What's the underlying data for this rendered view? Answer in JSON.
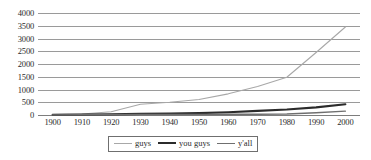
{
  "chart_data": {
    "type": "line",
    "title": "",
    "subtitle": "",
    "xlabel": "",
    "ylabel": "",
    "xlim": [
      1895,
      2005
    ],
    "ylim": [
      0,
      4000
    ],
    "grid": true,
    "legend_position": "bottom",
    "x": [
      1900,
      1910,
      1920,
      1930,
      1940,
      1950,
      1960,
      1970,
      1980,
      1990,
      2000
    ],
    "xtick_labels": [
      "1900",
      "1910",
      "1920",
      "1930",
      "1940",
      "1950",
      "1960",
      "1970",
      "1980",
      "1990",
      "2000"
    ],
    "ytick_labels": [
      "0",
      "500",
      "1000",
      "1500",
      "2000",
      "2500",
      "3000",
      "3500",
      "4000"
    ],
    "yticks": [
      0,
      500,
      1000,
      1500,
      2000,
      2500,
      3000,
      3500,
      4000
    ],
    "series": [
      {
        "name": "guys",
        "color": "#a8a8a8",
        "width": 1.1,
        "values": [
          20,
          40,
          130,
          420,
          500,
          610,
          830,
          1120,
          1480,
          2450,
          3450
        ]
      },
      {
        "name": "you guys",
        "color": "#2b2b2b",
        "width": 2.1,
        "values": [
          10,
          15,
          25,
          45,
          60,
          75,
          110,
          160,
          215,
          300,
          420
        ]
      },
      {
        "name": "y'all",
        "color": "#6f6f6f",
        "width": 1.4,
        "values": [
          5,
          8,
          12,
          18,
          22,
          25,
          28,
          32,
          40,
          90,
          150
        ]
      }
    ]
  },
  "legend": {
    "entries": [
      {
        "label": "guys"
      },
      {
        "label": "you guys"
      },
      {
        "label": "y'all"
      }
    ]
  }
}
